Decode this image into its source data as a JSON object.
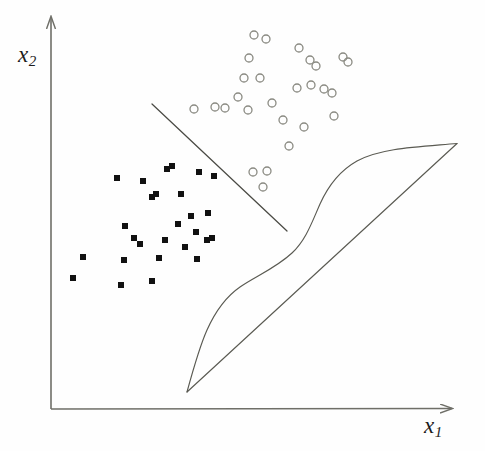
{
  "figure": {
    "title": "",
    "background_color": "#fefefe",
    "axis_color": "#6f6f68",
    "square_color": "#111111",
    "circle_stroke_color": "#8a8a82",
    "line_color": "#4a4a44"
  },
  "axes": {
    "x_label_text": "x",
    "x_label_sub": "1",
    "y_label_text": "x",
    "y_label_sub": "2",
    "x_axis": {
      "x1": 51,
      "y1": 409,
      "x2": 458,
      "y2": 408
    },
    "y_axis": {
      "x1": 51,
      "y1": 409,
      "x2": 51,
      "y2": 11
    }
  },
  "chart_data": {
    "type": "scatter",
    "title": "",
    "xlabel": "x1",
    "ylabel": "x2",
    "xlim": [
      51,
      458
    ],
    "ylim": [
      409,
      11
    ],
    "grid": false,
    "legend": "none",
    "annotations": [
      "straight linear decision boundary separating squares from circles",
      "sigmoid-shaped nonlinear curve with overlaid straight diagonal chord"
    ],
    "series": [
      {
        "name": "class-square",
        "marker": "filled-square",
        "color": "#111111",
        "marker_size": 6,
        "points": [
          [
            117,
            178
          ],
          [
            143,
            181
          ],
          [
            167,
            169
          ],
          [
            172,
            166
          ],
          [
            199,
            172
          ],
          [
            125,
            226
          ],
          [
            152,
            197
          ],
          [
            156,
            194
          ],
          [
            181,
            194
          ],
          [
            214,
            176
          ],
          [
            191,
            216
          ],
          [
            208,
            213
          ],
          [
            178,
            224
          ],
          [
            196,
            232
          ],
          [
            134,
            238
          ],
          [
            165,
            240
          ],
          [
            207,
            240
          ],
          [
            212,
            238
          ],
          [
            124,
            260
          ],
          [
            197,
            259
          ],
          [
            140,
            244
          ],
          [
            83,
            257
          ],
          [
            73,
            278
          ],
          [
            121,
            285
          ],
          [
            152,
            281
          ],
          [
            159,
            258
          ],
          [
            185,
            247
          ]
        ]
      },
      {
        "name": "class-circle",
        "marker": "open-circle",
        "color": "#8a8a82",
        "marker_size": 8,
        "points": [
          [
            266,
            39
          ],
          [
            299,
            48
          ],
          [
            249,
            58
          ],
          [
            310,
            60
          ],
          [
            316,
            66
          ],
          [
            343,
            57
          ],
          [
            348,
            62
          ],
          [
            254,
            35
          ],
          [
            297,
            88
          ],
          [
            311,
            85
          ],
          [
            324,
            89
          ],
          [
            332,
            93
          ],
          [
            244,
            78
          ],
          [
            260,
            78
          ],
          [
            194,
            109
          ],
          [
            215,
            107
          ],
          [
            248,
            110
          ],
          [
            225,
            108
          ],
          [
            283,
            120
          ],
          [
            304,
            127
          ],
          [
            334,
            116
          ],
          [
            289,
            146
          ],
          [
            253,
            172
          ],
          [
            267,
            171
          ],
          [
            263,
            187
          ],
          [
            238,
            97
          ],
          [
            272,
            103
          ]
        ]
      }
    ],
    "linear_boundary": {
      "name": "linear-decision-boundary",
      "x1": 152,
      "y1": 104,
      "x2": 287,
      "y2": 231
    },
    "diagonal_chord": {
      "name": "diagonal-reference-line",
      "x1": 187,
      "y1": 392,
      "x2": 458,
      "y2": 143
    },
    "sigmoid_curve": {
      "name": "sigmoid-nonlinear-boundary",
      "path": "M 187,392 C 193,370 199,348 207,330 C 216,310 227,296 240,287 C 256,276 276,268 292,253 C 306,240 312,222 320,204 C 329,184 341,170 357,161 C 381,148 417,147 458,143"
    }
  }
}
